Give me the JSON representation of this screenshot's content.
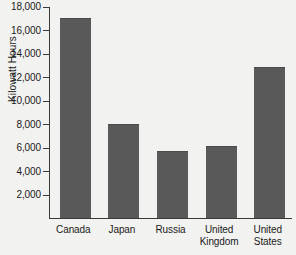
{
  "chart_data": {
    "type": "bar",
    "title": "",
    "subtitle": "",
    "xlabel": "",
    "ylabel": "Kilowatt Hours",
    "categories": [
      "Canada",
      "Japan",
      "Russia",
      "United Kingdom",
      "United States"
    ],
    "category_lines": [
      [
        "Canada"
      ],
      [
        "Japan"
      ],
      [
        "Russia"
      ],
      [
        "United",
        "Kingdom"
      ],
      [
        "United",
        "States"
      ]
    ],
    "values": [
      17000,
      8000,
      5700,
      6100,
      12800
    ],
    "ylim": [
      0,
      18000
    ],
    "yticks": [
      2000,
      4000,
      6000,
      8000,
      10000,
      12000,
      14000,
      16000,
      18000
    ],
    "ytick_labels": [
      "2,000",
      "4,000",
      "6,000",
      "8,000",
      "10,000",
      "12,000",
      "14,000",
      "16,000",
      "18,000"
    ],
    "grid": false,
    "legend": false,
    "legend_position": "none",
    "bar_color": "#595959",
    "axis_color": "#3a3a3a",
    "background_color": "#f2f2f0",
    "text_color": "#1a1a1a"
  }
}
